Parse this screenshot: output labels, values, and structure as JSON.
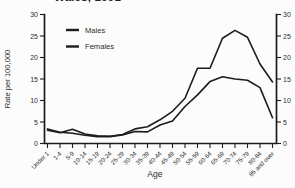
{
  "title": {
    "visible_fragment": "Wales, 1991"
  },
  "chart_data": {
    "type": "line",
    "title": "Wales, 1991",
    "xlabel": "Age",
    "ylabel": "Rate per 100,000",
    "ylim": [
      0,
      30
    ],
    "yticks": [
      0,
      5,
      10,
      15,
      20,
      25,
      30
    ],
    "right_axis_mirror": true,
    "grid": false,
    "legend_position": "top-left-inside",
    "categories": [
      "Under 1",
      "1-4",
      "5-9",
      "10-14",
      "15-19",
      "20-24",
      "25-29",
      "30-34",
      "35-39",
      "40-44",
      "45-49",
      "50-54",
      "55-59",
      "60-64",
      "65-69",
      "70-74",
      "75-79",
      "80-84",
      "85 and over"
    ],
    "series": [
      {
        "name": "Males",
        "color": "#1c1c1c",
        "values": [
          3.1,
          2.5,
          3.3,
          2.2,
          1.8,
          1.7,
          2.1,
          3.4,
          3.9,
          5.5,
          7.5,
          10.5,
          17.5,
          17.5,
          24.5,
          26.3,
          24.7,
          18.5,
          14.3
        ]
      },
      {
        "name": "Females",
        "color": "#1c1c1c",
        "values": [
          3.4,
          2.6,
          2.4,
          1.9,
          1.6,
          1.6,
          2.0,
          2.8,
          2.7,
          4.3,
          5.2,
          8.6,
          11.3,
          14.4,
          15.5,
          15.0,
          14.7,
          13.0,
          6.0
        ]
      }
    ]
  }
}
